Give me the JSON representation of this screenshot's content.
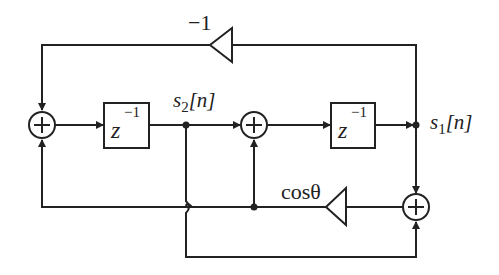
{
  "diagram": {
    "type": "signal-flow",
    "labels": {
      "gain_top": "−1",
      "gain_bottom": "cosθ",
      "delay1": "z",
      "delay1_exp": "−1",
      "delay2": "z",
      "delay2_exp": "−1",
      "s2_base": "s",
      "s2_sub": "2",
      "s2_arg": "[n]",
      "s1_base": "s",
      "s1_sub": "1",
      "s1_arg": "[n]"
    },
    "colors": {
      "stroke": "#222222",
      "background": "#ffffff"
    }
  }
}
